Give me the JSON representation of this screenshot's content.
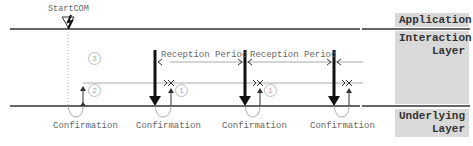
{
  "diagram": {
    "start_label": "StartCOM",
    "layers": [
      {
        "name": "application",
        "label": "Application"
      },
      {
        "name": "interaction",
        "label_line1": "Interaction",
        "label_line2": "Layer"
      },
      {
        "name": "underlying",
        "label_line1": "Underlying",
        "label_line2": "Layer"
      }
    ],
    "reception_periods": [
      "Reception Period",
      "Reception Period"
    ],
    "confirmations": [
      "Confirmation",
      "Confirmation",
      "Confirmation",
      "Confirmation"
    ],
    "step_markers": [
      "3",
      "2",
      "1",
      "1"
    ],
    "colors": {
      "layer_bg": "#d9d9d9",
      "line": "#333333",
      "thin_line": "#999999"
    }
  }
}
